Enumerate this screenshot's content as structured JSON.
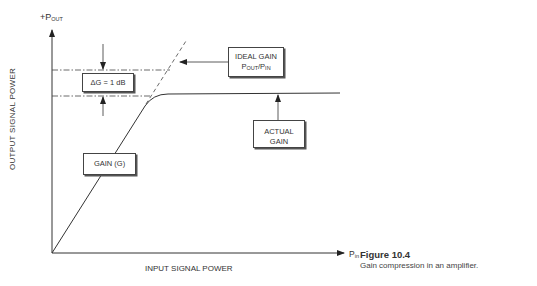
{
  "diagram": {
    "y_axis": {
      "label_prefix": "+P",
      "label_sub": "OUT",
      "title": "OUTPUT SIGNAL POWER"
    },
    "x_axis": {
      "label_prefix": "P",
      "label_sub": "in",
      "title": "INPUT SIGNAL POWER"
    },
    "boxes": {
      "delta_g": "ΔG = 1 dB",
      "ideal_gain": {
        "line1": "IDEAL GAIN",
        "p1": "P",
        "s1": "OUT",
        "slash": "/P",
        "s2": "IN"
      },
      "actual_gain": {
        "line1": "ACTUAL",
        "line2": "GAIN"
      },
      "gain_g": "GAIN (G)"
    },
    "curves": [
      {
        "name": "ideal-gain-line",
        "style": "dashed",
        "description": "linear extension of gain slope"
      },
      {
        "name": "actual-gain-curve",
        "style": "solid",
        "description": "linear then compresses to plateau"
      }
    ],
    "reference_lines": [
      {
        "name": "ideal-level",
        "style": "dash-dot"
      },
      {
        "name": "compressed-level",
        "style": "dash-dot"
      }
    ],
    "colors": {
      "line": "#333333",
      "background": "#ffffff"
    }
  },
  "caption": {
    "title": "Figure 10.4",
    "text": "Gain compression in an amplifier."
  }
}
